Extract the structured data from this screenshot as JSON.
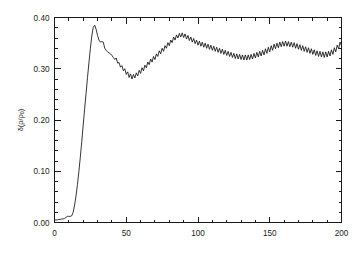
{
  "chart_data": {
    "type": "line",
    "title": "",
    "subtitle": "",
    "xlabel": "",
    "ylabel": "δ(ρ/ρ₀)",
    "ylabel_parts": {
      "symbol": "δ",
      "open": "(",
      "numerator": "ρ",
      "slash": "/",
      "denominator": "ρ",
      "subscript": "0",
      "close": ")"
    },
    "xlim": [
      0,
      200
    ],
    "ylim": [
      0.0,
      0.4
    ],
    "xticks": [
      0,
      50,
      100,
      150,
      200
    ],
    "xticklabels": [
      "0",
      "50",
      "100",
      "150",
      "200"
    ],
    "yticks": [
      0.0,
      0.1,
      0.2,
      0.3,
      0.4
    ],
    "yticklabels": [
      "0.00",
      "0.10",
      "0.20",
      "0.30",
      "0.40"
    ],
    "x_minor_tick_step": 10,
    "y_minor_tick_step": 0.02,
    "grid": false,
    "legend": null,
    "legend_position": "none",
    "line_color": "#101010",
    "background_color": "#ffffff",
    "frame_color": "#1a1a1a",
    "ticks_direction": "in",
    "annotations": [],
    "series": [
      {
        "name": "density contrast",
        "x": [
          0,
          1,
          2,
          3,
          4,
          5,
          6,
          7,
          8,
          9,
          10,
          11,
          12,
          13,
          14,
          15,
          16,
          17,
          18,
          19,
          20,
          21,
          22,
          23,
          24,
          25,
          26,
          27,
          28,
          29,
          30,
          31,
          32,
          33,
          34,
          35,
          36,
          37,
          38,
          39,
          40,
          41,
          42,
          43,
          44,
          45,
          46,
          47,
          48,
          49,
          50,
          51,
          52,
          53,
          54,
          55,
          56,
          57,
          58,
          59,
          60,
          61,
          62,
          63,
          64,
          65,
          66,
          67,
          68,
          69,
          70,
          71,
          72,
          73,
          74,
          75,
          76,
          77,
          78,
          79,
          80,
          81,
          82,
          83,
          84,
          85,
          86,
          87,
          88,
          89,
          90,
          91,
          92,
          93,
          94,
          95,
          96,
          97,
          98,
          99,
          100,
          101,
          102,
          103,
          104,
          105,
          106,
          107,
          108,
          109,
          110,
          111,
          112,
          113,
          114,
          115,
          116,
          117,
          118,
          119,
          120,
          121,
          122,
          123,
          124,
          125,
          126,
          127,
          128,
          129,
          130,
          131,
          132,
          133,
          134,
          135,
          136,
          137,
          138,
          139,
          140,
          141,
          142,
          143,
          144,
          145,
          146,
          147,
          148,
          149,
          150,
          151,
          152,
          153,
          154,
          155,
          156,
          157,
          158,
          159,
          160,
          161,
          162,
          163,
          164,
          165,
          166,
          167,
          168,
          169,
          170,
          171,
          172,
          173,
          174,
          175,
          176,
          177,
          178,
          179,
          180,
          181,
          182,
          183,
          184,
          185,
          186,
          187,
          188,
          189,
          190,
          191,
          192,
          193,
          194,
          195,
          196,
          197,
          198,
          199,
          200
        ],
        "y": [
          0.005,
          0.005,
          0.005,
          0.006,
          0.006,
          0.007,
          0.007,
          0.008,
          0.01,
          0.012,
          0.012,
          0.012,
          0.013,
          0.02,
          0.034,
          0.052,
          0.074,
          0.1,
          0.128,
          0.158,
          0.19,
          0.222,
          0.252,
          0.283,
          0.312,
          0.34,
          0.364,
          0.381,
          0.385,
          0.377,
          0.365,
          0.356,
          0.352,
          0.353,
          0.352,
          0.34,
          0.336,
          0.333,
          0.331,
          0.329,
          0.326,
          0.322,
          0.318,
          0.321,
          0.311,
          0.312,
          0.303,
          0.306,
          0.296,
          0.3,
          0.289,
          0.294,
          0.283,
          0.29,
          0.28,
          0.289,
          0.282,
          0.292,
          0.286,
          0.297,
          0.291,
          0.302,
          0.296,
          0.307,
          0.302,
          0.313,
          0.308,
          0.319,
          0.313,
          0.324,
          0.318,
          0.329,
          0.324,
          0.335,
          0.329,
          0.34,
          0.334,
          0.345,
          0.34,
          0.351,
          0.345,
          0.356,
          0.351,
          0.362,
          0.356,
          0.366,
          0.36,
          0.369,
          0.362,
          0.37,
          0.361,
          0.368,
          0.358,
          0.365,
          0.355,
          0.362,
          0.352,
          0.359,
          0.349,
          0.356,
          0.346,
          0.354,
          0.344,
          0.352,
          0.342,
          0.35,
          0.34,
          0.348,
          0.338,
          0.346,
          0.336,
          0.344,
          0.334,
          0.342,
          0.332,
          0.34,
          0.33,
          0.338,
          0.328,
          0.336,
          0.326,
          0.334,
          0.324,
          0.332,
          0.322,
          0.33,
          0.32,
          0.329,
          0.319,
          0.328,
          0.318,
          0.327,
          0.317,
          0.327,
          0.317,
          0.327,
          0.318,
          0.328,
          0.319,
          0.33,
          0.321,
          0.332,
          0.323,
          0.334,
          0.325,
          0.336,
          0.327,
          0.339,
          0.33,
          0.342,
          0.333,
          0.345,
          0.336,
          0.348,
          0.339,
          0.35,
          0.341,
          0.352,
          0.343,
          0.353,
          0.344,
          0.354,
          0.344,
          0.353,
          0.343,
          0.352,
          0.342,
          0.351,
          0.34,
          0.349,
          0.338,
          0.347,
          0.336,
          0.345,
          0.334,
          0.343,
          0.332,
          0.341,
          0.33,
          0.339,
          0.328,
          0.337,
          0.326,
          0.335,
          0.324,
          0.334,
          0.323,
          0.333,
          0.322,
          0.333,
          0.323,
          0.334,
          0.325,
          0.337,
          0.328,
          0.341,
          0.333,
          0.346,
          0.339,
          0.352,
          0.345
        ]
      }
    ]
  }
}
